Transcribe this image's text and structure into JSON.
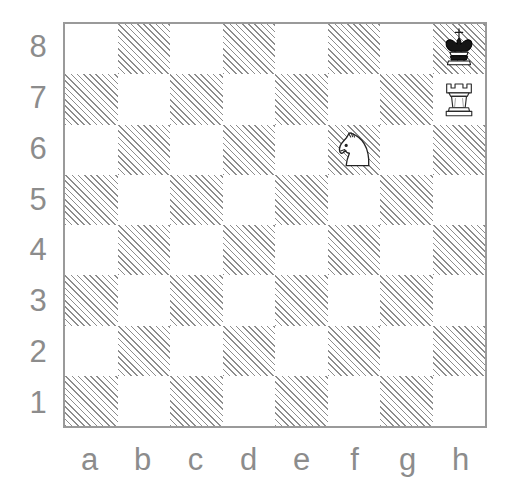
{
  "diagram": {
    "board": {
      "files": [
        "a",
        "b",
        "c",
        "d",
        "e",
        "f",
        "g",
        "h"
      ],
      "ranks": [
        "8",
        "7",
        "6",
        "5",
        "4",
        "3",
        "2",
        "1"
      ],
      "light_square_color": "#ffffff",
      "dark_square_fill": "hatched",
      "dark_square_line_color": "#8d8d8d",
      "border_color": "#9a9a9a",
      "label_color": "#8c8c8c",
      "orientation": "white-bottom"
    },
    "pieces": [
      {
        "square": "h8",
        "color": "black",
        "type": "king",
        "icon": "black-king-icon",
        "symbol": "♚"
      },
      {
        "square": "h7",
        "color": "white",
        "type": "rook",
        "icon": "white-rook-icon",
        "symbol": "♖"
      },
      {
        "square": "f6",
        "color": "white",
        "type": "knight",
        "icon": "white-knight-icon",
        "symbol": "♘"
      }
    ]
  },
  "chart_data": {
    "type": "table",
    "categories": [
      "a",
      "b",
      "c",
      "d",
      "e",
      "f",
      "g",
      "h"
    ],
    "ranks": [
      "8",
      "7",
      "6",
      "5",
      "4",
      "3",
      "2",
      "1"
    ],
    "xlabel": "files",
    "ylabel": "ranks",
    "grid": true,
    "legend": "none",
    "squares": {
      "rank8": [
        "light",
        "dark",
        "light",
        "dark",
        "light",
        "dark",
        "light",
        "dark"
      ],
      "rank7": [
        "dark",
        "light",
        "dark",
        "light",
        "dark",
        "light",
        "dark",
        "light"
      ],
      "rank6": [
        "light",
        "dark",
        "light",
        "dark",
        "light",
        "dark",
        "light",
        "dark"
      ],
      "rank5": [
        "dark",
        "light",
        "dark",
        "light",
        "dark",
        "light",
        "dark",
        "light"
      ],
      "rank4": [
        "light",
        "dark",
        "light",
        "dark",
        "light",
        "dark",
        "light",
        "dark"
      ],
      "rank3": [
        "dark",
        "light",
        "dark",
        "light",
        "dark",
        "light",
        "dark",
        "light"
      ],
      "rank2": [
        "light",
        "dark",
        "light",
        "dark",
        "light",
        "dark",
        "light",
        "dark"
      ],
      "rank1": [
        "dark",
        "light",
        "dark",
        "light",
        "dark",
        "light",
        "dark",
        "light"
      ]
    },
    "occupancy": [
      {
        "square": "h8",
        "piece": "black king"
      },
      {
        "square": "h7",
        "piece": "white rook"
      },
      {
        "square": "f6",
        "piece": "white knight"
      }
    ],
    "fen_placement": "7k/7R/5N2/8/8/8/8/8"
  }
}
